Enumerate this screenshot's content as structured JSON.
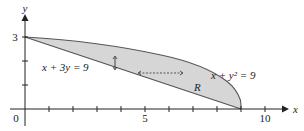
{
  "figure": {
    "axes": {
      "x_label": "x",
      "y_label": "y",
      "origin_label": "0",
      "x_tick_labels": {
        "5": "5",
        "10": "10"
      },
      "y_tick_labels": {
        "3": "3"
      },
      "x_ticks": [
        1,
        2,
        3,
        4,
        5,
        6,
        7,
        8,
        9,
        10
      ],
      "y_ticks": [
        1,
        2,
        3
      ]
    },
    "curves": [
      {
        "name": "line",
        "equation": "x + 3y = 9"
      },
      {
        "name": "parabola",
        "equation": "x + y² = 9"
      }
    ],
    "labels": {
      "line_label": "x + 3y = 9",
      "parabola_label": "x + y² = 9",
      "region_label": "R"
    },
    "colors": {
      "region_fill": "#d6d6d6",
      "curve_stroke": "#555555",
      "axis_stroke": "#222222"
    }
  }
}
